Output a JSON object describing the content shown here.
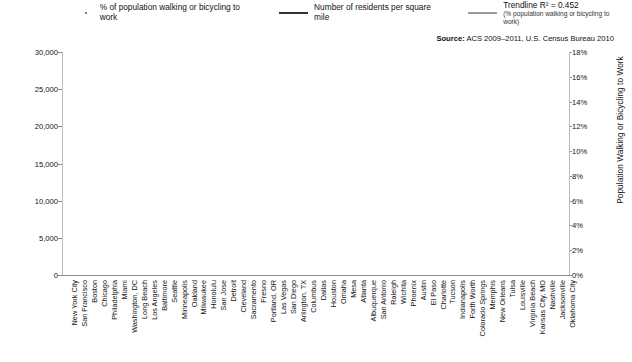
{
  "legend": [
    {
      "key": "scatter",
      "icon": "scatter-dot-icon",
      "label": "% of population walking or bicycling to work",
      "sub": ""
    },
    {
      "key": "line",
      "icon": "line-swatch-icon",
      "label": "Number of residents per square mile",
      "sub": ""
    },
    {
      "key": "trend",
      "icon": "trendline-swatch-icon",
      "label": "Trendline R² = 0.452",
      "sub": "(% population walking or bicycling to work)"
    }
  ],
  "source": {
    "prefix": "Source:",
    "text": " ACS 2009–2011, U.S. Census Bureau 2010"
  },
  "chart_data": {
    "type": "scatter",
    "title": "",
    "xlabel": "",
    "ylabel": "Residents per square mile",
    "y2label": "Population Walking or Bicycling to Work",
    "ylim": [
      0,
      30000
    ],
    "yticks": [
      0,
      5000,
      10000,
      15000,
      20000,
      25000,
      30000
    ],
    "ytick_labels": [
      "0",
      "5,000",
      "10,000",
      "15,000",
      "20,000",
      "25,000",
      "30,000"
    ],
    "y2lim": [
      0,
      18
    ],
    "y2ticks": [
      0,
      2,
      4,
      6,
      8,
      10,
      12,
      14,
      16,
      18
    ],
    "y2tick_labels": [
      "0%",
      "2%",
      "4%",
      "6%",
      "8%",
      "10%",
      "12%",
      "14%",
      "16%",
      "18%"
    ],
    "grid": false,
    "legend_position": "top",
    "categories": [
      "New York City",
      "San Francisco",
      "Boston",
      "Chicago",
      "Philadelphia",
      "Miami",
      "Washington, DC",
      "Long Beach",
      "Los Angeles",
      "Baltimore",
      "Seattle",
      "Minneapolis",
      "Oakland",
      "Milwaukee",
      "Honolulu",
      "San Jose",
      "Detroit",
      "Cleveland",
      "Sacramento",
      "Fresno",
      "Portland, OR",
      "Las Vegas",
      "San Diego",
      "Arlington, TX",
      "Columbus",
      "Dallas",
      "Houston",
      "Omaha",
      "Mesa",
      "Atlanta",
      "Albuquerque",
      "San Antonio",
      "Raleigh",
      "Wichita",
      "Phoenix",
      "Austin",
      "El Paso",
      "Charlotte",
      "Tucson",
      "Indianapolis",
      "Forth Worth",
      "Colorado Springs",
      "Memphis",
      "New Orleans",
      "Tulsa",
      "Louisville",
      "Virginia Beach",
      "Kansas City, MO",
      "Nashville",
      "Jacksonville",
      "Oklahoma City"
    ],
    "series": [
      {
        "name": "Number of residents per square mile",
        "type": "line",
        "axis": "left",
        "values": [
          27000,
          17300,
          13200,
          11900,
          11400,
          11100,
          9800,
          9200,
          8100,
          8000,
          7300,
          6900,
          7000,
          6200,
          5900,
          5400,
          5100,
          5000,
          4700,
          4600,
          4400,
          4300,
          4100,
          3900,
          3800,
          3600,
          3500,
          3400,
          3300,
          3200,
          3100,
          3000,
          2900,
          2800,
          2800,
          2800,
          2700,
          2600,
          2500,
          2400,
          2300,
          2200,
          2100,
          2000,
          1900,
          1800,
          1700,
          1500,
          1300,
          1100,
          900
        ]
      },
      {
        "name": "% of population walking or bicycling to work",
        "type": "scatter",
        "axis": "right",
        "values": [
          11.9,
          16.3,
          17.0,
          7.0,
          9.5,
          5.4,
          14.7,
          3.2,
          4.1,
          7.3,
          12.0,
          9.0,
          5.2,
          5.3,
          8.0,
          2.5,
          3.1,
          5.8,
          3.1,
          2.4,
          8.3,
          2.8,
          4.3,
          1.5,
          3.8,
          2.3,
          3.3,
          3.8,
          2.2,
          5.5,
          3.0,
          2.6,
          3.1,
          2.5,
          2.6,
          4.0,
          3.1,
          1.7,
          5.0,
          2.5,
          2.0,
          3.0,
          1.8,
          7.0,
          1.6,
          2.8,
          2.5,
          1.9,
          1.7,
          1.4,
          1.5
        ]
      },
      {
        "name": "Trendline R² = 0.452",
        "type": "line",
        "axis": "right",
        "values": [
          10.2,
          10.05,
          9.9,
          9.75,
          9.6,
          9.45,
          9.3,
          9.15,
          9.0,
          8.85,
          8.7,
          8.55,
          8.4,
          8.25,
          8.1,
          7.95,
          7.8,
          7.65,
          7.5,
          7.35,
          7.2,
          7.05,
          6.9,
          6.75,
          6.6,
          6.45,
          6.3,
          6.15,
          6.0,
          5.85,
          5.7,
          5.55,
          5.4,
          5.25,
          5.1,
          4.95,
          4.8,
          4.65,
          4.5,
          4.35,
          4.2,
          4.05,
          3.9,
          3.75,
          3.6,
          3.45,
          3.3,
          3.15,
          3.0,
          2.85,
          2.7
        ]
      }
    ],
    "colors": {
      "line": "#3f3f3f",
      "trend": "#a8a8a8",
      "scatter": "#555555",
      "axis": "#8c8c8c",
      "text": "#111111"
    }
  }
}
